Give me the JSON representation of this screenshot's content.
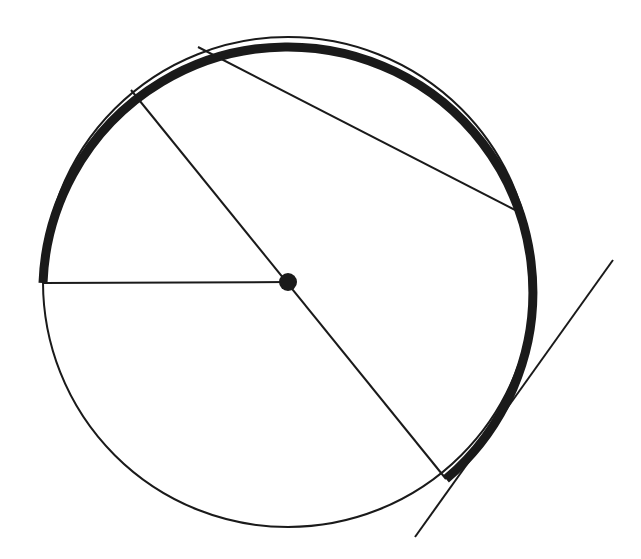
{
  "canvas": {
    "width": 641,
    "height": 559,
    "background": "#ffffff"
  },
  "figure": {
    "stroke_color": "#1a1a1a",
    "thin_stroke_width": 2.0,
    "thick_stroke_width": 9.0,
    "fill": "none"
  },
  "chart_data": {
    "type": "diagram",
    "xlabel": "",
    "ylabel": "",
    "units": "pixels",
    "coordinate_system": "screen (x right, y down)",
    "circle": {
      "name": "main-circle",
      "center": {
        "x": 288,
        "y": 282
      },
      "radius": 245,
      "stroke": "#1a1a1a",
      "stroke_width": 2.0,
      "fill": "none"
    },
    "center_point": {
      "name": "center-dot",
      "x": 288,
      "y": 282,
      "radius": 9,
      "fill": "#1a1a1a"
    },
    "segments": [
      {
        "name": "radius-horizontal",
        "role": "radius",
        "from": {
          "x": 288,
          "y": 282
        },
        "to": {
          "x": 43,
          "y": 283
        },
        "angle_deg": 180,
        "stroke_width": 2.0
      },
      {
        "name": "diameter-oblique",
        "role": "diameter",
        "from": {
          "x": 131,
          "y": 90
        },
        "to": {
          "x": 446,
          "y": 479
        },
        "angle_deg": 51,
        "stroke_width": 2.0
      },
      {
        "name": "chord-upper",
        "role": "chord",
        "from": {
          "x": 198,
          "y": 47
        },
        "to": {
          "x": 523,
          "y": 214
        },
        "stroke_width": 2.0
      },
      {
        "name": "tangent-line",
        "role": "tangent",
        "from": {
          "x": 613,
          "y": 260
        },
        "to": {
          "x": 415,
          "y": 537
        },
        "tangent_point": {
          "x": 483,
          "y": 442
        },
        "stroke_width": 2.0
      }
    ],
    "arcs": [
      {
        "name": "highlighted-arc",
        "role": "highlighted-arc",
        "center": {
          "x": 288,
          "y": 282
        },
        "radius": 245,
        "start_angle_deg": 180,
        "end_angle_deg": 51,
        "sweep": "clockwise-on-screen-through-bottom",
        "start_point": {
          "x": 43,
          "y": 283
        },
        "end_point": {
          "x": 446,
          "y": 479
        },
        "stroke": "#1a1a1a",
        "stroke_width": 9.0
      }
    ],
    "points_on_circle": [
      {
        "name": "point-left",
        "x": 43,
        "y": 283,
        "label": ""
      },
      {
        "name": "point-upper-left-diameter",
        "x": 131,
        "y": 90,
        "label": ""
      },
      {
        "name": "point-chord-start",
        "x": 198,
        "y": 47,
        "label": ""
      },
      {
        "name": "point-chord-end",
        "x": 523,
        "y": 214,
        "label": ""
      },
      {
        "name": "point-lower-right-diameter",
        "x": 446,
        "y": 479,
        "label": ""
      },
      {
        "name": "point-tangency",
        "x": 483,
        "y": 442,
        "label": ""
      }
    ],
    "annotations": [],
    "legend": [],
    "grid": false
  }
}
